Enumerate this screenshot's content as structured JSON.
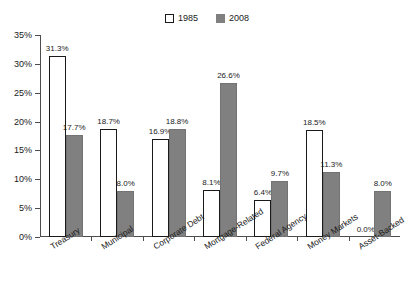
{
  "chart_data": {
    "type": "bar",
    "title": "",
    "subtitle": "",
    "xlabel": "",
    "ylabel": "",
    "categories": [
      "Treasury",
      "Municipal",
      "Corporate Debt",
      "Mortgage-Related",
      "Federal Agency",
      "Money Markets",
      "Asset-Backed"
    ],
    "series": [
      {
        "name": "1985",
        "color": "#ffffff",
        "values": [
          31.3,
          18.7,
          16.9,
          8.1,
          6.4,
          18.5,
          0.0
        ],
        "labels": [
          "31.3%",
          "18.7%",
          "16.9%",
          "8.1%",
          "6.4%",
          "18.5%",
          "0.0%"
        ]
      },
      {
        "name": "2008",
        "color": "#808080",
        "values": [
          17.7,
          8.0,
          18.8,
          26.6,
          9.7,
          11.3,
          8.0
        ],
        "labels": [
          "17.7%",
          "8.0%",
          "18.8%",
          "26.6%",
          "9.7%",
          "11.3%",
          "8.0%"
        ]
      }
    ],
    "ylim": [
      0,
      35
    ],
    "ytick_values": [
      0,
      5,
      10,
      15,
      20,
      25,
      30,
      35
    ],
    "ytick_labels": [
      "0%",
      "5%",
      "10%",
      "15%",
      "20%",
      "25%",
      "30%",
      "35%"
    ],
    "grid": false,
    "legend_position": "top-center",
    "value_labels": true
  },
  "legend": {
    "items": [
      {
        "label": "1985",
        "style": "open"
      },
      {
        "label": "2008",
        "style": "filled"
      }
    ]
  },
  "colors": {
    "series_1985": "#ffffff",
    "series_2008": "#808080",
    "axis": "#4d4d4d",
    "text": "#1a1a1a",
    "background": "#ffffff"
  }
}
